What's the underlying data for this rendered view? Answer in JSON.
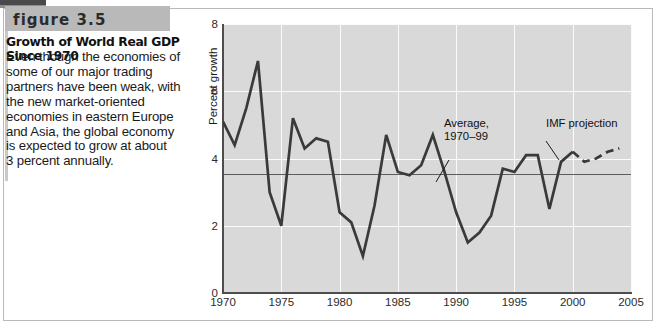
{
  "figure": {
    "label": "figure 3.5",
    "title": "Growth of World Real GDP Since 1970",
    "body_lines": [
      "Even though the economies of",
      "some of our major trading",
      "partners have been weak, with",
      "the new market-oriented",
      "economies in eastern Europe",
      "and Asia, the global economy",
      "is expected to grow at about",
      "3 percent annually."
    ]
  },
  "colors": {
    "plot_background": "#d9d9d9",
    "gridline": "#fbfbfb",
    "series_line": "#3a3a3a",
    "average_line": "#5c5c5c",
    "axis": "#4d4d4d",
    "band_background": "#b9b9b9",
    "frame_border": "#b9b9b9"
  },
  "annotations": [
    {
      "name": "average",
      "lines": [
        "Average,",
        "1970–99"
      ]
    },
    {
      "name": "imf-projection",
      "lines": [
        "IMF projection"
      ]
    }
  ],
  "chart_data": {
    "type": "line",
    "title": "Growth of World Real GDP Since 1970",
    "xlabel": "",
    "ylabel": "Percent growth",
    "xlim": [
      1970,
      2005
    ],
    "ylim": [
      0,
      8
    ],
    "xticks": [
      1970,
      1975,
      1980,
      1985,
      1990,
      1995,
      2000,
      2005
    ],
    "yticks": [
      0,
      2,
      4,
      6,
      8
    ],
    "xtick_labels": [
      "1970",
      "1975",
      "1980",
      "1985",
      "1990",
      "1995",
      "2000",
      "2005"
    ],
    "ytick_labels": [
      "0",
      "2",
      "4",
      "6",
      "8"
    ],
    "grid": true,
    "legend": false,
    "annotation_labels": [
      "Average, 1970–99",
      "IMF projection"
    ],
    "reference_line": {
      "label": "Average, 1970–99",
      "value": 3.55
    },
    "series": [
      {
        "name": "World real GDP growth (actual)",
        "style": "solid",
        "x": [
          1970,
          1971,
          1972,
          1973,
          1974,
          1975,
          1976,
          1977,
          1978,
          1979,
          1980,
          1981,
          1982,
          1983,
          1984,
          1985,
          1986,
          1987,
          1988,
          1989,
          1990,
          1991,
          1992,
          1993,
          1994,
          1995,
          1996,
          1997,
          1998,
          1999,
          2000
        ],
        "values": [
          5.1,
          4.4,
          5.5,
          6.9,
          3.0,
          2.0,
          5.2,
          4.3,
          4.6,
          4.5,
          2.4,
          2.1,
          1.1,
          2.6,
          4.7,
          3.6,
          3.5,
          3.8,
          4.7,
          3.6,
          2.4,
          1.5,
          1.8,
          2.3,
          3.7,
          3.6,
          4.1,
          4.1,
          2.5,
          3.9,
          4.2
        ]
      },
      {
        "name": "IMF projection",
        "style": "dashed",
        "x": [
          2000,
          2001,
          2002,
          2003,
          2004
        ],
        "values": [
          4.2,
          3.9,
          4.0,
          4.2,
          4.3
        ]
      }
    ]
  }
}
